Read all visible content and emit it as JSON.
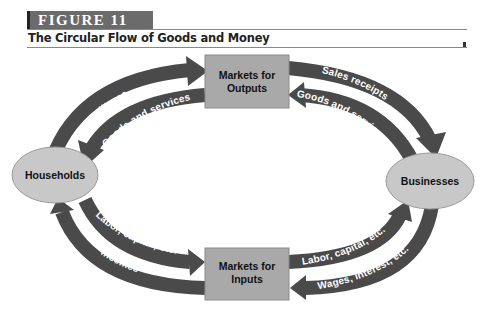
{
  "figure": {
    "label": "FIGURE 11",
    "title": "The Circular Flow of Goods and Money"
  },
  "nodes": {
    "markets_outputs": {
      "line1": "Markets for",
      "line2": "Outputs"
    },
    "markets_inputs": {
      "line1": "Markets for",
      "line2": "Inputs"
    },
    "households": {
      "label": "Households"
    },
    "businesses": {
      "label": "Businesses"
    }
  },
  "flows": {
    "expenditures": "Expenditures",
    "goods_services_to_households": "Goods and services",
    "sales_receipts": "Sales receipts",
    "goods_services_from_businesses": "Goods and services",
    "labor_capital_from_households": "Labor, capital, etc.",
    "incomes": "Incomes",
    "labor_capital_to_businesses": "Labor, capital, etc.",
    "wages_interest": "Wages, interest, etc."
  },
  "colors": {
    "arrow": "#4a4a4a",
    "box_fill": "#a9a9a9",
    "oval_fill": "#c8c8c8",
    "figure_bar": "#6b6b6b"
  }
}
